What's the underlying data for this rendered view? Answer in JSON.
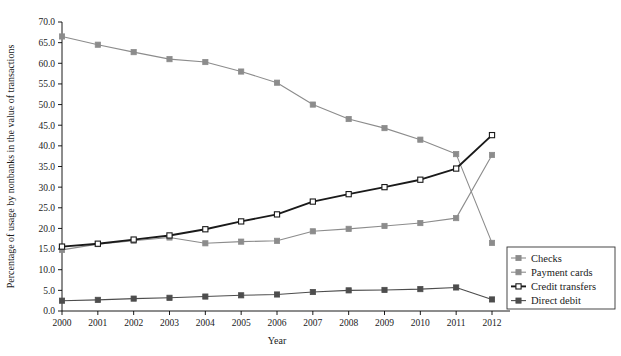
{
  "chart_data": {
    "type": "line",
    "title": "",
    "xlabel": "Year",
    "ylabel": "Percentage of usage by nonbanks in the value of transactions",
    "x": [
      2000,
      2001,
      2002,
      2003,
      2004,
      2005,
      2006,
      2007,
      2008,
      2009,
      2010,
      2011,
      2012
    ],
    "xlim": [
      2000,
      2012
    ],
    "ylim": [
      0.0,
      70.0
    ],
    "yticks": [
      "0.0",
      "5.0",
      "10.0",
      "15.0",
      "20.0",
      "25.0",
      "30.0",
      "35.0",
      "40.0",
      "45.0",
      "50.0",
      "55.0",
      "60.0",
      "65.0",
      "70.0"
    ],
    "xticks": [
      "2000",
      "2001",
      "2002",
      "2003",
      "2004",
      "2005",
      "2006",
      "2007",
      "2008",
      "2009",
      "2010",
      "2011",
      "2012"
    ],
    "grid": false,
    "legend_position": "right",
    "series": [
      {
        "name": "Checks",
        "color": "#8c8c8c",
        "marker": "square-filled",
        "values": [
          66.5,
          64.5,
          62.7,
          61.0,
          60.3,
          58.0,
          55.3,
          50.0,
          46.5,
          44.3,
          41.5,
          38.0,
          16.5
        ]
      },
      {
        "name": "Payment cards",
        "color": "#8c8c8c",
        "marker": "square-filled",
        "values": [
          14.8,
          16.2,
          17.0,
          17.8,
          16.4,
          16.8,
          17.0,
          19.3,
          19.9,
          20.6,
          21.3,
          22.5,
          37.8
        ]
      },
      {
        "name": "Credit transfers",
        "color": "#1a1a1a",
        "marker": "square-open",
        "values": [
          15.6,
          16.3,
          17.3,
          18.3,
          19.8,
          21.7,
          23.4,
          26.5,
          28.3,
          30.0,
          31.8,
          34.5,
          42.6
        ]
      },
      {
        "name": "Direct debit",
        "color": "#4d4d4d",
        "marker": "square-filled",
        "values": [
          2.5,
          2.7,
          3.0,
          3.2,
          3.5,
          3.8,
          4.0,
          4.6,
          5.0,
          5.1,
          5.3,
          5.7,
          2.8
        ]
      }
    ]
  },
  "legend": {
    "items": [
      {
        "label": "Checks"
      },
      {
        "label": "Payment cards"
      },
      {
        "label": "Credit transfers"
      },
      {
        "label": "Direct debit"
      }
    ]
  }
}
